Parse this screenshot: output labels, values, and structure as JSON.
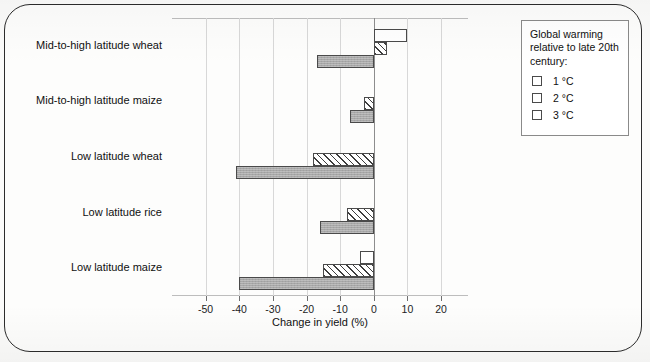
{
  "chart_data": {
    "type": "bar",
    "orientation": "horizontal",
    "title": "",
    "xlabel": "Change in yield (%)",
    "ylabel": "",
    "xlim": [
      -60,
      28
    ],
    "xticks": [
      -50,
      -40,
      -30,
      -20,
      -10,
      0,
      10,
      20
    ],
    "xtick_labels": [
      "-50",
      "-40",
      "-30",
      "-20",
      "-10",
      "0",
      "10",
      "20"
    ],
    "grid": true,
    "legend_position": "right-outside",
    "categories": [
      "Mid-to-high latitude wheat",
      "Mid-to-high latitude maize",
      "Low latitude wheat",
      "Low latitude rice",
      "Low latitude maize"
    ],
    "series": [
      {
        "name": "1 °C",
        "fill": "white",
        "values": [
          10,
          null,
          null,
          null,
          -4
        ]
      },
      {
        "name": "2 °C",
        "fill": "hatched",
        "values": [
          4,
          -3,
          -18,
          -8,
          -15
        ]
      },
      {
        "name": "3 °C",
        "fill": "grey",
        "values": [
          -17,
          -7,
          -41,
          -16,
          -40
        ]
      }
    ]
  },
  "legend": {
    "title": "Global warming relative to late 20th century:",
    "items": [
      {
        "label": "1 °C",
        "swatch": "empty-swatch-icon"
      },
      {
        "label": "2 °C",
        "swatch": "hatched-swatch-icon"
      },
      {
        "label": "3 °C",
        "swatch": "grey-swatch-icon"
      }
    ]
  },
  "colors": {
    "bar_outline": "#4a4a4a",
    "bar_grey_fill": "#a8a8a8",
    "hatch_stroke": "#3d3d3d",
    "gridline": "#d8d8d8",
    "zero_line": "#8d8d8d",
    "frame": "#2c2c2c",
    "text": "#101010"
  }
}
